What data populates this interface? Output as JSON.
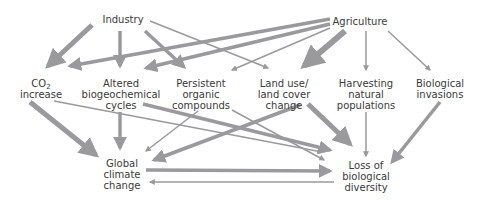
{
  "diagram": {
    "colors": {
      "arrow": "#9a9a9c",
      "text": "#3a3a3a",
      "background": "#ffffff"
    },
    "nodes": {
      "industry": {
        "lines": [
          "Industry"
        ]
      },
      "agriculture": {
        "lines": [
          "Agriculture"
        ]
      },
      "co2": {
        "lines": [
          "CO",
          "2",
          "increase"
        ]
      },
      "altered": {
        "lines": [
          "Altered",
          "biogeochemical",
          "cycles"
        ]
      },
      "persistent": {
        "lines": [
          "Persistent",
          "organic",
          "compounds"
        ]
      },
      "landuse": {
        "lines": [
          "Land use/",
          "land cover",
          "change"
        ]
      },
      "harvesting": {
        "lines": [
          "Harvesting",
          "natural",
          "populations"
        ]
      },
      "invasions": {
        "lines": [
          "Biological",
          "invasions"
        ]
      },
      "climate": {
        "lines": [
          "Global",
          "climate",
          "change"
        ]
      },
      "biodiversity": {
        "lines": [
          "Loss of",
          "biological",
          "diversity"
        ]
      }
    },
    "edges": [
      {
        "from": "industry",
        "to": "co2",
        "weight": "thick"
      },
      {
        "from": "industry",
        "to": "altered",
        "weight": "medium"
      },
      {
        "from": "industry",
        "to": "persistent",
        "weight": "medium"
      },
      {
        "from": "industry",
        "to": "landuse",
        "weight": "thin"
      },
      {
        "from": "agriculture",
        "to": "co2",
        "weight": "medium"
      },
      {
        "from": "agriculture",
        "to": "altered",
        "weight": "medium"
      },
      {
        "from": "agriculture",
        "to": "persistent",
        "weight": "thin"
      },
      {
        "from": "agriculture",
        "to": "landuse",
        "weight": "thick"
      },
      {
        "from": "agriculture",
        "to": "harvesting",
        "weight": "thin"
      },
      {
        "from": "agriculture",
        "to": "invasions",
        "weight": "thin"
      },
      {
        "from": "co2",
        "to": "climate",
        "weight": "thick"
      },
      {
        "from": "co2",
        "to": "biodiversity",
        "weight": "thin"
      },
      {
        "from": "altered",
        "to": "climate",
        "weight": "medium"
      },
      {
        "from": "altered",
        "to": "biodiversity",
        "weight": "medium"
      },
      {
        "from": "persistent",
        "to": "climate",
        "weight": "thin"
      },
      {
        "from": "persistent",
        "to": "biodiversity",
        "weight": "thin"
      },
      {
        "from": "landuse",
        "to": "climate",
        "weight": "medium"
      },
      {
        "from": "landuse",
        "to": "biodiversity",
        "weight": "thick"
      },
      {
        "from": "harvesting",
        "to": "biodiversity",
        "weight": "thin"
      },
      {
        "from": "invasions",
        "to": "biodiversity",
        "weight": "medium"
      },
      {
        "from": "climate",
        "to": "biodiversity",
        "weight": "medium"
      },
      {
        "from": "biodiversity",
        "to": "climate",
        "weight": "thin"
      }
    ]
  }
}
